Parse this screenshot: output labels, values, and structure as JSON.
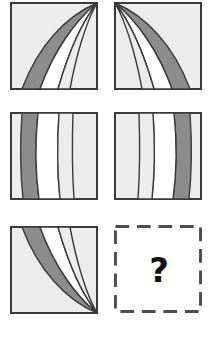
{
  "puzzle": {
    "type": "visual-analogy-matrix",
    "rows": 3,
    "columns": 2,
    "answer_placeholder": "?"
  },
  "colors": {
    "page_background": "#ffffff",
    "cell_background": "#ececec",
    "band_gray": "#8c8c8c",
    "band_white": "#ffffff",
    "cell_border": "#3a3a3a",
    "answer_border": "#4d4d4d",
    "answer_mark": "#111111"
  },
  "geometry": {
    "cell_size": 88,
    "answer_cell_size": 90,
    "column_gutter": 14,
    "row_gutter": 22,
    "border_width": 2,
    "dash_length": 14,
    "dash_gap": 8
  },
  "cells": [
    {
      "id": "cell-1",
      "position": "row1-col1",
      "name": "converging-bands-top-right",
      "description": "Gray and white curved bands converging to a point at the top-right corner",
      "convergence_corner": "top-right",
      "band_order": [
        "gray",
        "white"
      ],
      "x": 10,
      "y": 2
    },
    {
      "id": "cell-2",
      "position": "row1-col2",
      "name": "converging-bands-top-left",
      "description": "Mirror of cell 1: gray and white curved bands converging at the top-left corner",
      "convergence_corner": "top-left",
      "band_order": [
        "white",
        "gray"
      ],
      "x": 114,
      "y": 2
    },
    {
      "id": "cell-3",
      "position": "row2-col1",
      "name": "vertical-bands-gray-left",
      "description": "Near-vertical slightly curved bands with the gray band on the left side",
      "convergence_corner": "none",
      "band_order": [
        "gray",
        "white"
      ],
      "x": 10,
      "y": 112
    },
    {
      "id": "cell-4",
      "position": "row2-col2",
      "name": "vertical-bands-gray-right",
      "description": "Mirror of cell 3: near-vertical bands with the gray band on the right side",
      "convergence_corner": "none",
      "band_order": [
        "white",
        "gray"
      ],
      "x": 114,
      "y": 112
    },
    {
      "id": "cell-5",
      "position": "row3-col1",
      "name": "converging-bands-bottom-right",
      "description": "Gray and white curved bands converging to a point at the bottom-right corner",
      "convergence_corner": "bottom-right",
      "band_order": [
        "gray",
        "white"
      ],
      "x": 10,
      "y": 226
    },
    {
      "id": "cell-6",
      "position": "row3-col2",
      "name": "answer-cell",
      "description": "Empty dashed-outline cell containing a bold question mark",
      "convergence_corner": "unknown",
      "x": 114,
      "y": 225
    }
  ]
}
